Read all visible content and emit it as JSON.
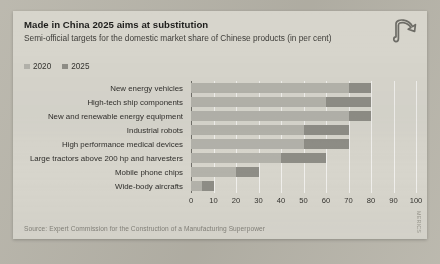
{
  "card": {
    "title": "Made in China 2025 aims at substitution",
    "subtitle": "Semi-official targets for the domestic market share of Chinese products (in per cent)",
    "source": "Source: Expert Commission for the Construction of a Manufacturing Superpower",
    "credit": "MERICS",
    "logo_icon": "merics-ribbon-logo-icon"
  },
  "colors": {
    "card_background": "#d7d5cc",
    "page_background": "#b8b5aa",
    "series_2020": "#b3b2aa",
    "series_2025": "#8e8d86",
    "title_text": "#1d1d1b",
    "gridline": "#ffffff",
    "axis": "#6f6e68"
  },
  "legend": {
    "position": "top-left",
    "items": [
      {
        "label": "2020",
        "color": "#b3b2aa"
      },
      {
        "label": "2025",
        "color": "#8e8d86"
      }
    ]
  },
  "chart_data": {
    "type": "bar",
    "orientation": "horizontal",
    "title": "Made in China 2025 aims at substitution",
    "subtitle": "Semi-official targets for the domestic market share of Chinese products (in per cent)",
    "xlabel": "",
    "ylabel": "",
    "xlim": [
      0,
      100
    ],
    "xticks": [
      0,
      10,
      20,
      30,
      40,
      50,
      60,
      70,
      80,
      90,
      100
    ],
    "grid": true,
    "legend_position": "top-left",
    "categories": [
      "New energy vehicles",
      "High-tech ship components",
      "New and renewable energy equipment",
      "Industrial robots",
      "High performance medical devices",
      "Large tractors above 200 hp and harvesters",
      "Mobile phone chips",
      "Wide-body aircrafts"
    ],
    "series": [
      {
        "name": "2020",
        "color": "#b3b2aa",
        "values": [
          70,
          60,
          70,
          50,
          50,
          40,
          20,
          5
        ]
      },
      {
        "name": "2025",
        "color": "#8e8d86",
        "values": [
          80,
          80,
          80,
          70,
          70,
          60,
          30,
          10
        ]
      }
    ]
  }
}
